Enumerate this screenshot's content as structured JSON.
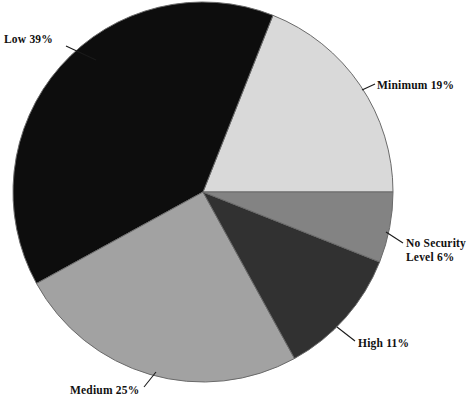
{
  "chart_data": {
    "type": "pie",
    "title": "",
    "subtitle": "",
    "xlabel": "",
    "ylabel": "",
    "legend_position": "none",
    "grid": false,
    "units": "percent",
    "total": 100,
    "start_angle_deg": 0,
    "direction": "counterclockwise",
    "categories": [
      "Minimum",
      "Low",
      "Medium",
      "High",
      "No Security Level"
    ],
    "values": [
      19,
      39,
      25,
      11,
      6
    ],
    "slices": [
      {
        "name": "Minimum",
        "value": 19,
        "label": "Minimum 19%",
        "color": "#d9d9d9",
        "start_deg": 0,
        "end_deg": 68.4
      },
      {
        "name": "Low",
        "value": 39,
        "label": "Low 39%",
        "color": "#0d0d0d",
        "start_deg": 68.4,
        "end_deg": 208.8
      },
      {
        "name": "Medium",
        "value": 25,
        "label": "Medium 25%",
        "color": "#a2a2a2",
        "start_deg": 208.8,
        "end_deg": 298.8
      },
      {
        "name": "High",
        "value": 11,
        "label": "High 11%",
        "color": "#313131",
        "start_deg": 298.8,
        "end_deg": 338.4
      },
      {
        "name": "No Security Level",
        "value": 6,
        "label": "No Security Level 6%",
        "color": "#838383",
        "start_deg": 338.4,
        "end_deg": 360
      }
    ]
  },
  "labels": {
    "low": "Low 39%",
    "minimum": "Minimum 19%",
    "no_security_line1": "No Security",
    "no_security_line2": "Level 6%",
    "high": "High 11%",
    "medium": "Medium 25%"
  },
  "geometry": {
    "center_x": 203,
    "center_y": 192,
    "radius": 190,
    "outline_color": "#6a6a6a",
    "background": "#ffffff"
  }
}
